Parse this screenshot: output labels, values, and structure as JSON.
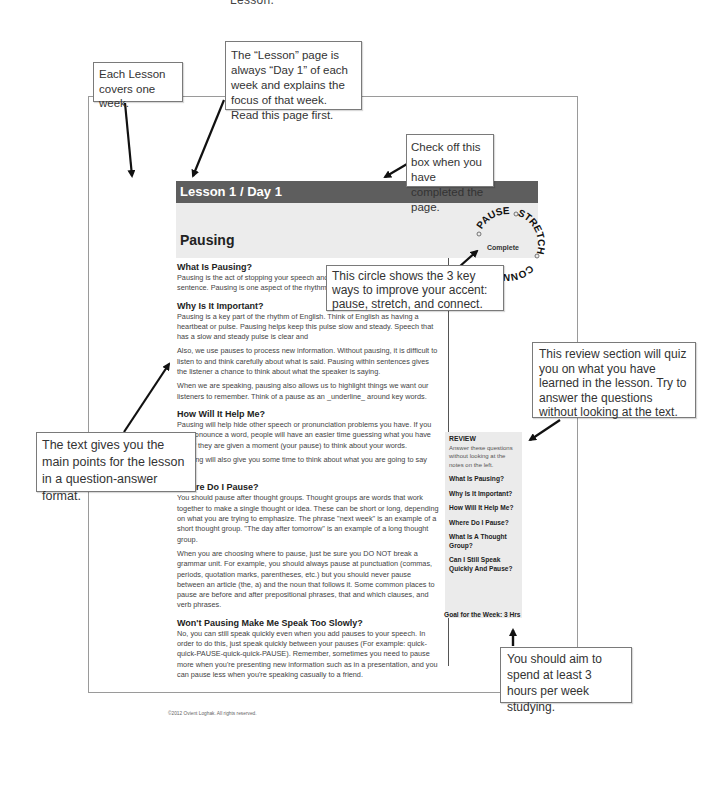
{
  "top_caption": "Lesson.",
  "lesson_page": {
    "header": "Lesson 1 / Day 1",
    "title": "Pausing",
    "complete_label": "Complete",
    "sections": [
      {
        "heading": "What Is Pausing?",
        "paragraphs": [
          "Pausing is the act of stopping your speech and letting silence be part of your sentence. Pausing is one aspect of the rhythm of English."
        ]
      },
      {
        "heading": "Why Is It Important?",
        "paragraphs": [
          "Pausing is a key part of the rhythm of English. Think of English as having a heartbeat or pulse. Pausing helps keep this pulse slow and steady. Speech that has a slow and steady pulse is clear and",
          "Also, we use pauses to process new information. Without pausing, it is difficult to listen to and think carefully about what is said. Pausing within sentences gives the listener a chance to think about what the speaker is saying.",
          "When we are speaking, pausing also allows us to highlight things we want our listeners to remember. Think of a pause as an _underline_ around key words."
        ]
      },
      {
        "heading": "How Will It Help Me?",
        "paragraphs": [
          "Pausing will help hide other speech or pronunciation problems you have. If you mispronounce a word, people will have an easier time guessing what you have said if they are given a moment (your pause) to think about your words.",
          "Pausing will also give you some time to think about what you are going to say next!"
        ]
      },
      {
        "heading": "Where Do I Pause?",
        "paragraphs": [
          "You should pause after thought groups. Thought groups are words that work together to make a single thought or idea. These can be short or long, depending on what you are trying to emphasize. The phrase \"next week\" is an example of a short thought group. \"The day after tomorrow\" is an example of a long thought group.",
          "When you are choosing where to pause, just be sure you DO NOT break a grammar unit. For example, you should always pause at punctuation (commas, periods, quotation marks, parentheses, etc.) but you should never pause between an article (the, a) and the noun that follows it. Some common places to pause are before and after prepositional phrases, that and which clauses, and verb phrases."
        ]
      },
      {
        "heading": "Won't Pausing Make Me Speak Too Slowly?",
        "paragraphs": [
          "No, you can still speak quickly even when you add pauses to your speech. In order to do this, just speak quickly between your pauses (For example: quick-quick-PAUSE-quick-quick-PAUSE). Remember, sometimes you need to pause more when you're presenting new information such as in a presentation, and you can pause less when you're speaking casually to a friend."
        ]
      }
    ],
    "circle_words": [
      "PAUSE",
      "STRETCH",
      "CONNECT"
    ],
    "review": {
      "heading": "REVIEW",
      "instructions": "Answer these questions without looking at the notes on the left.",
      "questions": [
        "What Is Pausing?",
        "Why Is It Important?",
        "How Will It Help Me?",
        "Where Do I Pause?",
        "What Is A Thought Group?",
        "Can I Still Speak Quickly And Pause?"
      ]
    },
    "goal": "Goal for the Week: 3 Hrs",
    "copyright": "©2012 Ovient Loghak. All rights reserved."
  },
  "callouts": {
    "lesson_week": "Each Lesson covers one week.",
    "day_one": "The “Lesson” page is always “Day 1” of each week and explains the focus of that week. Read this page first.",
    "complete_box": "Check off this box when you have completed the page.",
    "circle": "This circle shows the 3 key ways to improve your accent: pause, stretch, and connect.",
    "review": "This review section will quiz you on what you have learned in the lesson. Try to answer the questions without looking at the text.",
    "text": "The text gives you the main points for the lesson in a question-answer format.",
    "goal": "You should aim to spend at least 3 hours per week studying."
  }
}
